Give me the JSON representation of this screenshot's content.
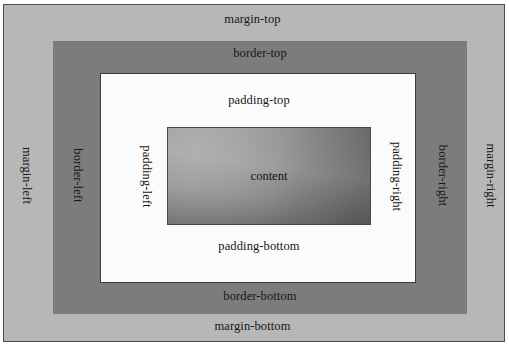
{
  "diagram": {
    "canvas": {
      "width": 509,
      "height": 347
    },
    "colors": {
      "page_background": "#ffffff",
      "outer_frame_line": "#4c4c4c",
      "margin_fill": "#b7b7b7",
      "border_fill": "#7c7c7c",
      "padding_fill": "#fbfbfb",
      "padding_outline": "#3d3d3d",
      "content_outline": "#484848",
      "content_gradient_light": "#a3a3a3",
      "content_gradient_dark": "#575757",
      "label_text": "#161616"
    },
    "boxes": {
      "margin": {
        "name": "margin-box"
      },
      "border": {
        "name": "border-box"
      },
      "padding": {
        "name": "padding-box"
      },
      "content": {
        "name": "content-box"
      }
    },
    "labels": {
      "margin_top": "margin-top",
      "margin_right": "margin-right",
      "margin_bottom": "margin-bottom",
      "margin_left": "margin-left",
      "border_top": "border-top",
      "border_right": "border-right",
      "border_bottom": "border-bottom",
      "border_left": "border-left",
      "padding_top": "padding-top",
      "padding_right": "padding-right",
      "padding_bottom": "padding-bottom",
      "padding_left": "padding-left",
      "content": "content"
    }
  }
}
